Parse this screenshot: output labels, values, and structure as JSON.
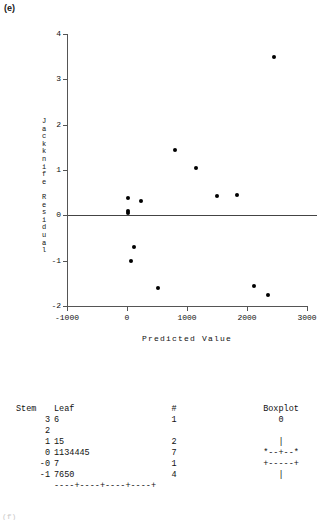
{
  "figure": {
    "panel_label": "(e)",
    "bottom_fragment": "(f)"
  },
  "chart_data": {
    "type": "scatter",
    "title": "",
    "xlabel": "Predicted Value",
    "ylabel": "Jackknife Residual",
    "ylabel_letters": [
      "J",
      "a",
      "c",
      "k",
      "k",
      "n",
      "i",
      "f",
      "e",
      "",
      "R",
      "e",
      "s",
      "i",
      "d",
      "u",
      "a",
      "l"
    ],
    "xlim": [
      -1000,
      3000
    ],
    "ylim": [
      -2,
      4
    ],
    "xticks": [
      -1000,
      0,
      1000,
      2000,
      3000
    ],
    "xtick_labels": [
      "-1000",
      "0",
      "1000",
      "2000",
      "3000"
    ],
    "yticks": [
      -2,
      -1,
      0,
      1,
      2,
      3,
      4
    ],
    "ytick_labels": [
      "-2",
      "-1",
      "0",
      "1",
      "2",
      "3",
      "4"
    ],
    "grid": false,
    "reference_line_y": 0,
    "points": [
      {
        "x": 2450,
        "y": 3.5
      },
      {
        "x": 800,
        "y": 1.45
      },
      {
        "x": 1150,
        "y": 1.05
      },
      {
        "x": 20,
        "y": 0.38
      },
      {
        "x": 230,
        "y": 0.32
      },
      {
        "x": 1500,
        "y": 0.42
      },
      {
        "x": 1830,
        "y": 0.44
      },
      {
        "x": 10,
        "y": 0.1
      },
      {
        "x": 15,
        "y": 0.05
      },
      {
        "x": 120,
        "y": -0.7
      },
      {
        "x": 60,
        "y": -1.0
      },
      {
        "x": 520,
        "y": -1.6
      },
      {
        "x": 2120,
        "y": -1.55
      },
      {
        "x": 2350,
        "y": -1.75
      }
    ]
  },
  "stem_leaf": {
    "headers": {
      "stem": "Stem",
      "leaf": "Leaf",
      "count": "#",
      "boxplot": "Boxplot"
    },
    "outlier_marker": "0",
    "rows": [
      {
        "stem": "3",
        "leaf": "6",
        "count": "1",
        "boxplot": "0"
      },
      {
        "stem": "2",
        "leaf": "",
        "count": "",
        "boxplot": ""
      },
      {
        "stem": "1",
        "leaf": "15",
        "count": "2",
        "boxplot": "|"
      },
      {
        "stem": "0",
        "leaf": "1134445",
        "count": "7",
        "boxplot": "*--+--*"
      },
      {
        "stem": "-0",
        "leaf": "7",
        "count": "1",
        "boxplot": "+-----+"
      },
      {
        "stem": "-1",
        "leaf": "7650",
        "count": "4",
        "boxplot": "|"
      }
    ],
    "axis_line": "----+----+----+----+"
  }
}
